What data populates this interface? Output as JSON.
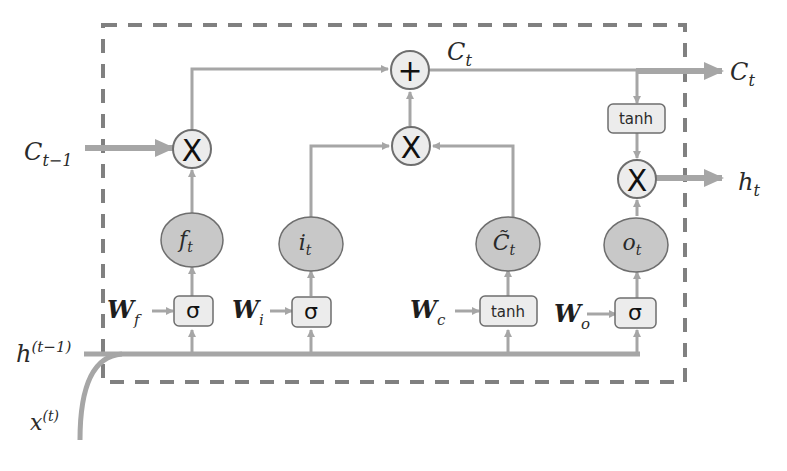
{
  "diagram": {
    "colors": {
      "line": "#a6a6a6",
      "dashed_border": "#808080",
      "node_fill": "#c8c8c8",
      "node_stroke": "#6e6e6e",
      "box_fill": "#ececec",
      "op_fill": "#ececec",
      "text": "#2a2a2a"
    },
    "inputs": {
      "cell_prev": {
        "base": "C",
        "sub": "t−1"
      },
      "hidden_prev": {
        "base": "h",
        "sup": "(t−1)"
      },
      "x_input": {
        "base": "x",
        "sup": "(t)"
      }
    },
    "outputs": {
      "cell_out": {
        "base": "C",
        "sub": "t"
      },
      "hidden_out": {
        "base": "h",
        "sub": "t"
      }
    },
    "inner_labels": {
      "cell_state": {
        "base": "C",
        "sub": "t"
      }
    },
    "operators": {
      "add": "+",
      "multiply_forget": "X",
      "multiply_input": "X",
      "multiply_output": "X"
    },
    "output_activation": "tanh",
    "gates": [
      {
        "id": "forget",
        "node": {
          "base": "f",
          "sub": "t"
        },
        "weight": {
          "base": "W",
          "sub": "f"
        },
        "activation": "σ"
      },
      {
        "id": "input",
        "node": {
          "base": "i",
          "sub": "t"
        },
        "weight": {
          "base": "W",
          "sub": "i"
        },
        "activation": "σ"
      },
      {
        "id": "candidate",
        "node": {
          "base": "C̃",
          "sub": "t"
        },
        "weight": {
          "base": "W",
          "sub": "c"
        },
        "activation": "tanh"
      },
      {
        "id": "output",
        "node": {
          "base": "o",
          "sub": "t"
        },
        "weight": {
          "base": "W",
          "sub": "o"
        },
        "activation": "σ"
      }
    ]
  }
}
